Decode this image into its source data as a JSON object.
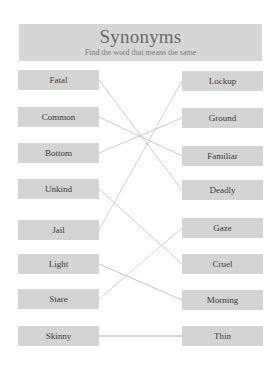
{
  "header": {
    "title": "Synonyms",
    "subtitle": "Find the word that means the same"
  },
  "left_words": [
    "Fatal",
    "Common",
    "Bottom",
    "Unkind",
    "Jail",
    "Light",
    "Stare",
    "Skinny"
  ],
  "right_words": [
    "Lockup",
    "Ground",
    "Familiar",
    "Deadly",
    "Gaze",
    "Cruel",
    "Morning",
    "Thin"
  ],
  "matches": [
    {
      "left": "Fatal",
      "right": "Deadly"
    },
    {
      "left": "Common",
      "right": "Familiar"
    },
    {
      "left": "Bottom",
      "right": "Ground"
    },
    {
      "left": "Unkind",
      "right": "Cruel"
    },
    {
      "left": "Jail",
      "right": "Lockup"
    },
    {
      "left": "Light",
      "right": "Morning"
    },
    {
      "left": "Stare",
      "right": "Gaze"
    },
    {
      "left": "Skinny",
      "right": "Thin"
    }
  ],
  "colors": {
    "box": "#d4d4d4",
    "header": "#d6d6d6",
    "line": "#b8b8b8"
  }
}
